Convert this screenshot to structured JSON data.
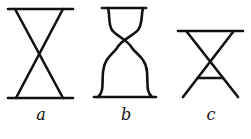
{
  "figures": [
    {
      "id": "a",
      "label": "a",
      "description": "hourglass with straight crossed lines"
    },
    {
      "id": "b",
      "label": "b",
      "description": "hourglass with curved bell-shaped sides"
    },
    {
      "id": "c",
      "label": "c",
      "description": "crossed lines with top bar and small lower crossbar"
    }
  ],
  "colors": {
    "stroke": "#111111",
    "background": "#ffffff"
  }
}
